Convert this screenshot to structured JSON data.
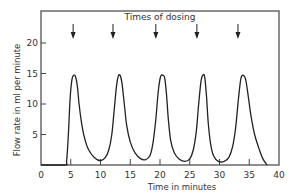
{
  "chart_data": {
    "type": "line",
    "title": "",
    "annotation": "Times of dosing",
    "xlabel": "Time in minutes",
    "ylabel": "Flow rate in ml per minute",
    "xlim": [
      0,
      40
    ],
    "ylim": [
      0,
      25
    ],
    "xticks": [
      0,
      5,
      10,
      15,
      20,
      25,
      30,
      35,
      40
    ],
    "yticks": [
      5,
      10,
      15,
      20
    ],
    "grid": false,
    "legend": null,
    "dosing_times": [
      5.4,
      12.1,
      19.3,
      26.2,
      33.1
    ],
    "series": [
      {
        "name": "Flow rate",
        "x": [
          0,
          4.0,
          4.3,
          4.6,
          4.9,
          5.2,
          5.5,
          5.8,
          6.1,
          6.4,
          6.8,
          7.3,
          8.0,
          9.0,
          10.0,
          10.8,
          11.4,
          11.9,
          12.3,
          12.7,
          13.0,
          13.3,
          13.6,
          14.0,
          14.4,
          15.0,
          15.8,
          16.8,
          17.6,
          18.3,
          18.8,
          19.3,
          19.7,
          20.1,
          20.5,
          20.8,
          21.1,
          21.4,
          21.8,
          22.4,
          23.2,
          24.2,
          25.0,
          25.6,
          26.1,
          26.5,
          26.9,
          27.2,
          27.5,
          27.8,
          28.1,
          28.5,
          29.0,
          29.8,
          30.8,
          31.6,
          32.2,
          32.7,
          33.2,
          33.6,
          34.0,
          34.4,
          34.8,
          35.3,
          35.9,
          36.6,
          37.3,
          38.0
        ],
        "y": [
          0,
          0,
          0.6,
          5.0,
          11.0,
          14.0,
          14.7,
          14.5,
          13.0,
          10.0,
          7.0,
          4.5,
          2.5,
          1.2,
          0.7,
          1.2,
          2.5,
          5.0,
          9.0,
          13.0,
          14.6,
          14.7,
          13.5,
          10.0,
          6.5,
          3.8,
          2.0,
          1.0,
          0.9,
          1.5,
          3.5,
          7.5,
          12.0,
          14.5,
          14.7,
          14.2,
          11.5,
          7.5,
          4.0,
          2.0,
          1.0,
          0.6,
          1.0,
          2.5,
          5.5,
          10.0,
          13.8,
          14.7,
          14.5,
          11.5,
          7.0,
          3.5,
          1.5,
          0.6,
          0.6,
          1.3,
          3.0,
          6.0,
          11.0,
          14.2,
          14.7,
          14.0,
          11.5,
          8.0,
          5.0,
          2.8,
          1.0,
          0
        ]
      }
    ]
  }
}
